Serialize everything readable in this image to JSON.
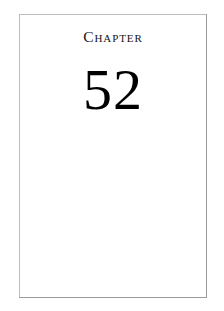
{
  "document": {
    "page_background": "#ffffff",
    "sheet_background": "#ffffff",
    "border_light_color": "#bcbcbc",
    "border_shadow_color": "#808080",
    "text_color": "#151515",
    "number_color": "#000000"
  },
  "chapter": {
    "heading_label": "Chapter",
    "number": "52"
  },
  "body": {
    "content": ""
  }
}
